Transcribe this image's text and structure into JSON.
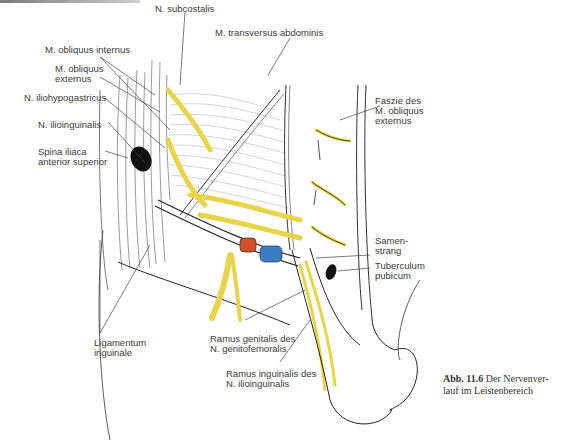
{
  "figure": {
    "caption": {
      "number": "Abb. 11.6",
      "text_line1": "Der Nervenver-",
      "text_line2": "lauf im Leistenbereich"
    },
    "labels": {
      "n_subcostalis": "N. subcostalis",
      "m_transversus_abdominis": "M. transversus abdominis",
      "m_obliquus_internus": "M. obliquus internus",
      "m_obliquus_externus_1": "M. obliquus",
      "m_obliquus_externus_2": "externus",
      "n_iliohypogastricus": "N. iliohypogastricus",
      "n_ilioinguinalis": "N. ilioinguinalis",
      "spina_iliaca_1": "Spina iliaca",
      "spina_iliaca_2": "anterior superior",
      "faszie_1": "Faszie des",
      "faszie_2": "M. obliquus",
      "faszie_3": "externus",
      "samenstrang_1": "Samen-",
      "samenstrang_2": "strang",
      "tuberculum_1": "Tuberculum",
      "tuberculum_2": "pubicum",
      "ligamentum_1": "Ligamentum",
      "ligamentum_2": "inguinale",
      "ramus_genitalis_1": "Ramus genitalis des",
      "ramus_genitalis_2": "N. genitofemoralis",
      "ramus_inguinalis_1": "Ramus inguinalis des",
      "ramus_inguinalis_2": "N. ilioinguinalis"
    },
    "colors": {
      "nerve": "#e8d44a",
      "artery": "#d0502a",
      "vein": "#3a7fc4",
      "outline": "#2a2a2a",
      "leader": "#444444"
    }
  }
}
